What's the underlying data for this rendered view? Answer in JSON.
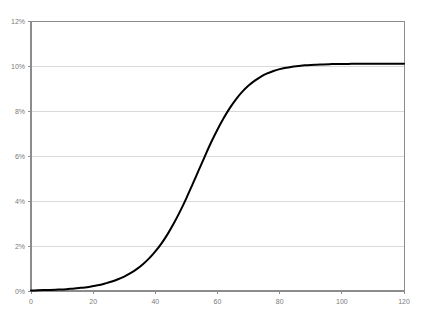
{
  "chart_data": {
    "type": "line",
    "title": "",
    "subtitle": "",
    "xlabel": "",
    "ylabel": "",
    "xlim": [
      0,
      120
    ],
    "ylim": [
      0,
      12
    ],
    "grid": "horizontal",
    "legend": "none",
    "series": [
      {
        "name": "logistic-curve",
        "color": "#000000",
        "line_width": 2,
        "x": [
          0,
          2,
          4,
          6,
          8,
          10,
          12,
          14,
          16,
          18,
          20,
          22,
          24,
          26,
          28,
          30,
          32,
          34,
          36,
          38,
          40,
          42,
          44,
          46,
          48,
          50,
          52,
          54,
          56,
          58,
          60,
          62,
          64,
          66,
          68,
          70,
          72,
          74,
          76,
          78,
          80,
          82,
          84,
          86,
          88,
          90,
          92,
          94,
          96,
          98,
          100,
          102,
          104,
          106,
          108,
          110,
          112,
          114,
          116,
          118,
          120
        ],
        "y": [
          0.02,
          0.03,
          0.04,
          0.05,
          0.06,
          0.07,
          0.09,
          0.11,
          0.14,
          0.17,
          0.22,
          0.27,
          0.34,
          0.42,
          0.52,
          0.64,
          0.79,
          0.97,
          1.19,
          1.45,
          1.76,
          2.12,
          2.54,
          3.02,
          3.55,
          4.13,
          4.75,
          5.38,
          6.01,
          6.62,
          7.18,
          7.69,
          8.14,
          8.53,
          8.86,
          9.13,
          9.35,
          9.53,
          9.67,
          9.78,
          9.86,
          9.92,
          9.97,
          10.0,
          10.03,
          10.05,
          10.06,
          10.07,
          10.08,
          10.09,
          10.09,
          10.09,
          10.1,
          10.1,
          10.1,
          10.1,
          10.1,
          10.1,
          10.1,
          10.1,
          10.1
        ]
      }
    ],
    "y_ticks": [
      {
        "value": 0,
        "label": "0%"
      },
      {
        "value": 2,
        "label": "2%"
      },
      {
        "value": 4,
        "label": "4%"
      },
      {
        "value": 6,
        "label": "6%"
      },
      {
        "value": 8,
        "label": "8%"
      },
      {
        "value": 10,
        "label": "10%"
      },
      {
        "value": 12,
        "label": "12%"
      }
    ],
    "x_ticks": [
      {
        "value": 0,
        "label": "0"
      },
      {
        "value": 20,
        "label": "20"
      },
      {
        "value": 40,
        "label": "40"
      },
      {
        "value": 60,
        "label": "60"
      },
      {
        "value": 80,
        "label": "80"
      },
      {
        "value": 100,
        "label": "100"
      },
      {
        "value": 120,
        "label": "120"
      }
    ],
    "colors": {
      "background": "#ffffff",
      "axis": "#8c8c8c",
      "gridline": "#d9d9d9",
      "curve": "#000000",
      "tick_label": "#7a7a7a"
    },
    "plot_area": {
      "left": 31,
      "top": 21,
      "right": 404,
      "bottom": 291
    }
  }
}
